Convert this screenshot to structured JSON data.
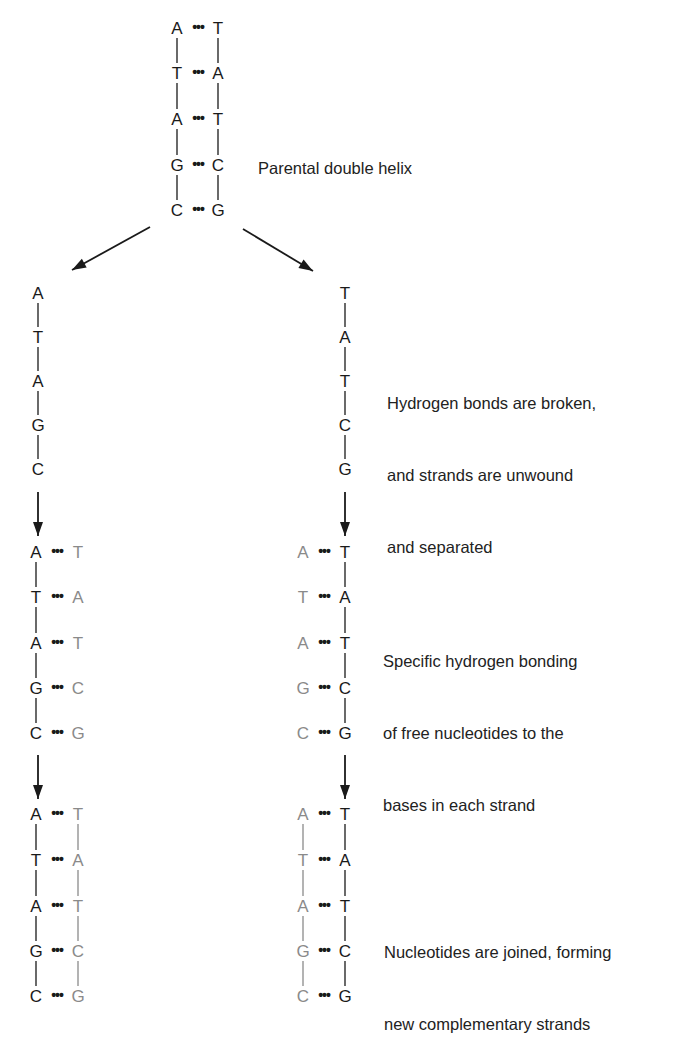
{
  "figure": {
    "colors": {
      "parental_strand": "#1a1a1a",
      "new_strand": "#8a8a8a",
      "arrow": "#1a1a1a"
    }
  },
  "captions": {
    "parental": [
      "Parental double helix"
    ],
    "separation": [
      "Hydrogen bonds are broken,",
      "and strands are unwound",
      "and separated"
    ],
    "pairing": [
      "Specific hydrogen bonding",
      "of free nucleotides to the",
      "bases in each strand"
    ],
    "joining": [
      "Nucleotides are joined, forming",
      "new complementary strands"
    ]
  },
  "parental_helix": {
    "left": [
      "A",
      "T",
      "A",
      "G",
      "C"
    ],
    "right": [
      "T",
      "A",
      "T",
      "C",
      "G"
    ]
  },
  "separated_strands": {
    "left": [
      "A",
      "T",
      "A",
      "G",
      "C"
    ],
    "right": [
      "T",
      "A",
      "T",
      "C",
      "G"
    ]
  },
  "pairing_stage": {
    "left_helix": {
      "old": [
        "A",
        "T",
        "A",
        "G",
        "C"
      ],
      "new": [
        "T",
        "A",
        "T",
        "C",
        "G"
      ],
      "new_backbone": false
    },
    "right_helix": {
      "new": [
        "A",
        "T",
        "A",
        "G",
        "C"
      ],
      "old": [
        "T",
        "A",
        "T",
        "C",
        "G"
      ],
      "new_backbone": false
    }
  },
  "joined_stage": {
    "left_helix": {
      "old": [
        "A",
        "T",
        "A",
        "G",
        "C"
      ],
      "new": [
        "T",
        "A",
        "T",
        "C",
        "G"
      ],
      "new_backbone": true
    },
    "right_helix": {
      "new": [
        "A",
        "T",
        "A",
        "G",
        "C"
      ],
      "old": [
        "T",
        "A",
        "T",
        "C",
        "G"
      ],
      "new_backbone": true
    }
  },
  "symbols": {
    "hydrogen_bond": "•••",
    "backbone": "|"
  }
}
